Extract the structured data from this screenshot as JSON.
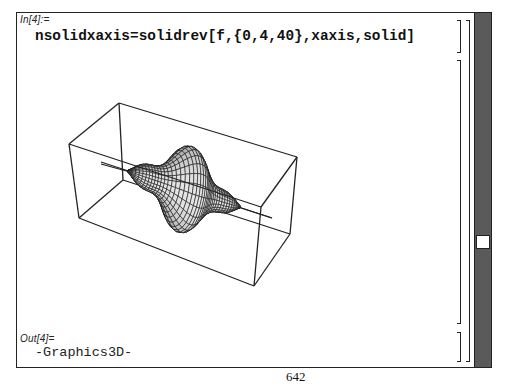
{
  "notebook": {
    "input_label": "In[4]:=",
    "input_code": "nsolidxaxis=solidrev[f,{0,4,40},xaxis,solid]",
    "output_label": "Out[4]=",
    "output_value": "-Graphics3D-"
  },
  "graphic": {
    "type": "solid-of-revolution",
    "axis": "x",
    "range": [
      0,
      4,
      40
    ],
    "style": "solid mesh",
    "colors": {
      "edge": "#222222",
      "mesh": "#111111",
      "fill_light": "#d8d8d8",
      "fill_dark": "#555555"
    }
  },
  "scrollbar": {
    "orientation": "vertical",
    "thumb_position_pct": 66
  },
  "page": {
    "number": "642"
  }
}
